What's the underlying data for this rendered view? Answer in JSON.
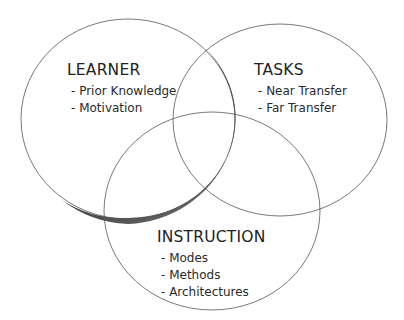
{
  "diagram": {
    "type": "venn",
    "sets": [
      {
        "id": "learner",
        "title": "LEARNER",
        "items": [
          "- Prior Knowledge",
          "- Motivation"
        ],
        "emphasized": true
      },
      {
        "id": "tasks",
        "title": "TASKS",
        "items": [
          "- Near Transfer",
          "- Far Transfer"
        ],
        "emphasized": false
      },
      {
        "id": "instruction",
        "title": "INSTRUCTION",
        "items": [
          "- Modes",
          "- Methods",
          "- Architectures"
        ],
        "emphasized": false
      }
    ],
    "colors": {
      "outline": "#555555",
      "shadow": "#4a4a4a",
      "text": "#222222",
      "background": "#ffffff"
    }
  }
}
